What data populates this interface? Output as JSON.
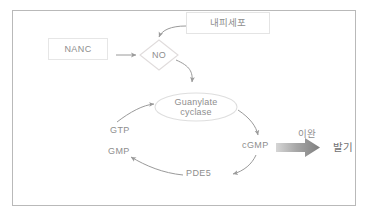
{
  "figure": {
    "frame_color": "#b9b9b9",
    "text_color": "#8e8e8e",
    "arrow_color": "#9a9a9a",
    "block_arrow_color": "#8d8d8d"
  },
  "nodes": {
    "nanc": {
      "label": "NANC",
      "shape": "rectangle"
    },
    "endothelium": {
      "label": "내피세포",
      "shape": "rectangle"
    },
    "no": {
      "label": "NO",
      "shape": "diamond"
    },
    "guanylate_cyclase": {
      "label": "Guanylate\ncyclase",
      "shape": "ellipse"
    },
    "gtp": {
      "label": "GTP",
      "shape": "text"
    },
    "gmp": {
      "label": "GMP",
      "shape": "text"
    },
    "cgmp": {
      "label": "cGMP",
      "shape": "text"
    },
    "pde5": {
      "label": "PDE5",
      "shape": "text"
    }
  },
  "outcome": {
    "arrow_label": "이완",
    "result_label": "발기",
    "arrow_style": "block-arrow-gray"
  },
  "edges": [
    {
      "from": "nanc",
      "to": "no",
      "style": "straight-arrow"
    },
    {
      "from": "endothelium",
      "to": "no",
      "style": "curved-arrow"
    },
    {
      "from": "no",
      "to": "guanylate_cyclase",
      "style": "curved-arrow"
    },
    {
      "from": "gtp",
      "to": "guanylate_cyclase",
      "style": "curved-arrow"
    },
    {
      "from": "guanylate_cyclase",
      "to": "cgmp",
      "style": "curved-arrow"
    },
    {
      "from": "cgmp",
      "to": "pde5",
      "style": "curved-arrow"
    },
    {
      "from": "pde5",
      "to": "gmp",
      "style": "curved-arrow"
    },
    {
      "from": "cgmp",
      "to": "erection",
      "style": "block-arrow"
    }
  ]
}
